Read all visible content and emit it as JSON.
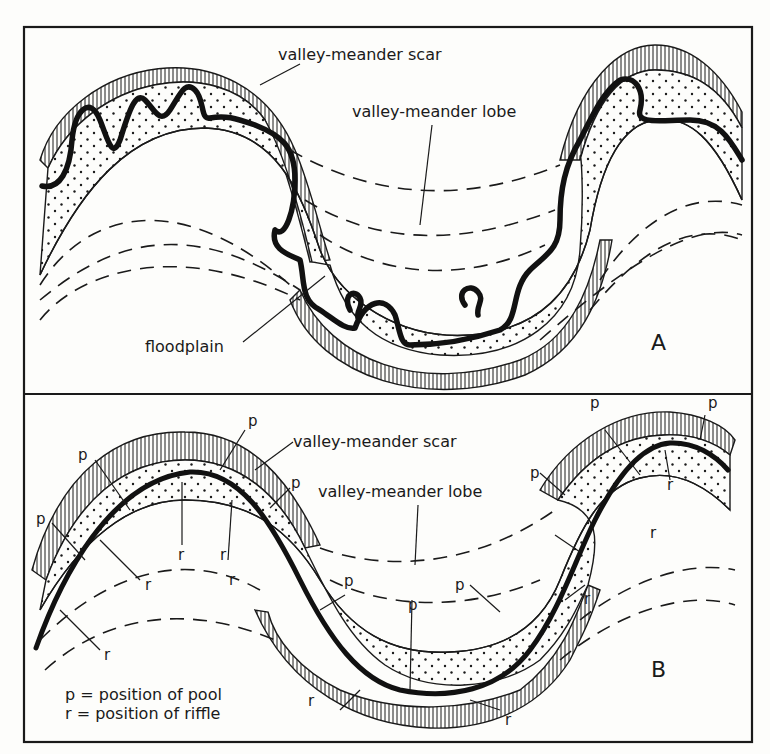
{
  "figure": {
    "panel_a": {
      "letter": "A",
      "labels": {
        "scar": "valley-meander scar",
        "lobe": "valley-meander lobe",
        "floodplain": "floodplain"
      }
    },
    "panel_b": {
      "letter": "B",
      "labels": {
        "scar": "valley-meander scar",
        "lobe": "valley-meander lobe"
      },
      "markers": {
        "pool": "p",
        "riffle": "r"
      },
      "legend": {
        "pool": "p = position of pool",
        "riffle": "r = position of riffle"
      }
    }
  },
  "colors": {
    "ink": "#1a1a1a",
    "paper": "#fdfdfb"
  }
}
